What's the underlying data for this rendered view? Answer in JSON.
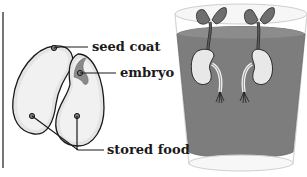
{
  "diagram": {
    "labels": {
      "seed_coat": "seed coat",
      "embryo": "embryo",
      "stored_food": "stored food"
    },
    "colors": {
      "outline": "#1a1a1a",
      "seed_fill": "#e6e6e6",
      "seed_inner": "#f2f2f2",
      "embryo": "#8a8a8a",
      "water": "#7f7f7f",
      "glass": "#d9d9d9",
      "leaf": "#6e6e6e"
    }
  }
}
